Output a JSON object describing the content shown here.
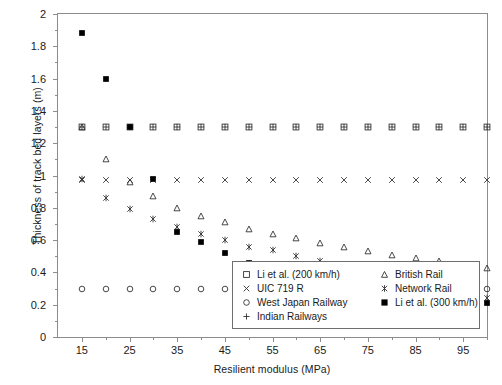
{
  "chart_data": {
    "type": "scatter",
    "title": "",
    "xlabel": "Resilient modulus (MPa)",
    "ylabel": "Thickness of track bed layers (m)",
    "xlim": [
      10,
      100
    ],
    "ylim": [
      2,
      0
    ],
    "y_inverted": true,
    "grid": false,
    "legend_position": "bottom-right",
    "xticks": [
      15,
      25,
      35,
      45,
      55,
      65,
      75,
      85,
      95
    ],
    "xtick_labels": [
      "15",
      "25",
      "35",
      "45",
      "55",
      "65",
      "75",
      "85",
      "95"
    ],
    "xticks_minor": [
      20,
      30,
      40,
      50,
      60,
      70,
      80,
      90,
      100
    ],
    "yticks": [
      0,
      0.2,
      0.4,
      0.6,
      0.8,
      1,
      1.2,
      1.4,
      1.6,
      1.8,
      2
    ],
    "ytick_labels": [
      "0",
      "0.2",
      "0.4",
      "0.6",
      "0.8",
      "1",
      "1.2",
      "1.4",
      "1.6",
      "1.8",
      "2"
    ],
    "yticks_minor": [
      0.1,
      0.3,
      0.5,
      0.7,
      0.9,
      1.1,
      1.3,
      1.5,
      1.7,
      1.9
    ],
    "x": [
      15,
      20,
      25,
      30,
      35,
      40,
      45,
      50,
      55,
      60,
      65,
      70,
      75,
      80,
      85,
      90,
      95,
      100
    ],
    "series": [
      {
        "name": "Li et al. (200 km/h)",
        "marker": "open-square",
        "color": "#333333",
        "values": [
          1.3,
          1.3,
          1.3,
          1.3,
          1.3,
          1.3,
          1.3,
          1.3,
          1.3,
          1.3,
          1.3,
          1.3,
          1.3,
          1.3,
          1.3,
          1.3,
          1.3,
          1.3
        ]
      },
      {
        "name": "UIC 719 R",
        "marker": "cross-x",
        "color": "#333333",
        "values": [
          0.97,
          0.97,
          0.97,
          0.97,
          0.97,
          0.97,
          0.97,
          0.97,
          0.97,
          0.97,
          0.97,
          0.97,
          0.97,
          0.97,
          0.97,
          0.97,
          0.97,
          0.97
        ]
      },
      {
        "name": "West Japan Railway",
        "marker": "open-circle",
        "color": "#333333",
        "values": [
          0.3,
          0.3,
          0.3,
          0.3,
          0.3,
          0.3,
          0.3,
          0.3,
          0.3,
          0.3,
          0.3,
          0.3,
          0.3,
          0.3,
          0.3,
          0.3,
          0.3,
          0.3
        ]
      },
      {
        "name": "Indian Railways",
        "marker": "plus",
        "color": "#333333",
        "values": [
          1.3,
          1.3,
          1.3,
          1.3,
          1.3,
          1.3,
          1.3,
          1.3,
          1.3,
          1.3,
          1.3,
          1.3,
          1.3,
          1.3,
          1.3,
          1.3,
          1.3,
          1.3
        ]
      },
      {
        "name": "British Rail",
        "marker": "open-triangle",
        "color": "#333333",
        "values": [
          1.3,
          1.1,
          0.96,
          0.87,
          0.8,
          0.75,
          0.71,
          0.67,
          0.64,
          0.61,
          0.58,
          0.56,
          0.53,
          0.51,
          0.49,
          0.47,
          0.45,
          0.43
        ]
      },
      {
        "name": "Network Rail",
        "marker": "star-asterisk",
        "color": "#333333",
        "values": [
          0.98,
          0.86,
          0.79,
          0.73,
          0.68,
          0.64,
          0.6,
          0.56,
          0.54,
          0.5,
          0.47,
          0.44,
          0.41,
          0.38,
          0.35,
          0.32,
          0.28,
          0.24
        ]
      },
      {
        "name": "Li et al. (300 km/h)",
        "marker": "filled-square",
        "color": "#000000",
        "values": [
          1.88,
          1.6,
          1.3,
          0.98,
          0.65,
          0.59,
          0.52,
          0.46,
          0.44,
          0.41,
          0.38,
          0.35,
          0.33,
          0.3,
          0.28,
          0.26,
          0.24,
          0.21
        ]
      }
    ]
  },
  "legend": {
    "column_a": [
      {
        "label": "Li et al. (200 km/h)",
        "marker": "open-square"
      },
      {
        "label": "UIC 719 R",
        "marker": "cross-x"
      },
      {
        "label": "West Japan Railway",
        "marker": "open-circle"
      },
      {
        "label": "Indian Railways",
        "marker": "plus"
      }
    ],
    "column_b": [
      {
        "label": "British Rail",
        "marker": "open-triangle"
      },
      {
        "label": "Network Rail",
        "marker": "star-asterisk"
      },
      {
        "label": "Li et al. (300 km/h)",
        "marker": "filled-square"
      }
    ]
  }
}
